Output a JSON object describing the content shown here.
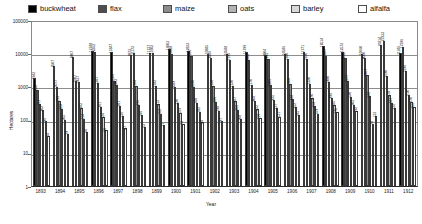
{
  "chart_data": {
    "type": "bar",
    "title": "",
    "xlabel": "Year",
    "ylabel": "Hectares",
    "yscale": "log",
    "ylim": [
      1,
      100000
    ],
    "ytick_labels": [
      "100000",
      "10000",
      "1000",
      "100",
      "10",
      "1"
    ],
    "grid": true,
    "legend_position": "top",
    "categories": [
      "1893",
      "1894",
      "1895",
      "1896",
      "1897",
      "1898",
      "1899",
      "1900",
      "1901",
      "1902",
      "1903",
      "1904",
      "1905",
      "1906",
      "1907",
      "1908",
      "1909",
      "1910",
      "1911",
      "1912"
    ],
    "series": [
      {
        "name": "buckwheat",
        "color": "#000000",
        "values": [
          1942,
          4507,
          8407,
          12748,
          11847,
          9873,
          11737,
          14603,
          12833,
          10885,
          10588,
          11799,
          9904,
          10586,
          11771,
          18514,
          12572,
          10660,
          20214,
          11186
        ]
      },
      {
        "name": "flax",
        "color": "#4d4d4d",
        "values": [
          858,
          1077,
          1607,
          12362,
          1626,
          11172,
          11602,
          10348,
          9186,
          8246,
          7196,
          6904,
          7295,
          7280,
          7240,
          9347,
          8042,
          8000,
          27233,
          17396
        ]
      },
      {
        "name": "maize",
        "color": "#8c8c8c",
        "values": [
          311,
          393,
          1437,
          1347,
          1203,
          1144,
          1142,
          1049,
          1080,
          1150,
          1120,
          1170,
          1206,
          1300,
          1320,
          1480,
          1577,
          2407,
          2190,
          3196
        ]
      },
      {
        "name": "oats",
        "color": "#b3b3b3",
        "values": [
          202,
          223,
          242,
          261,
          281,
          296,
          312,
          330,
          348,
          366,
          387,
          404,
          425,
          448,
          470,
          496,
          520,
          548,
          578,
          610
        ]
      },
      {
        "name": "barley",
        "color": "#d9d9d9",
        "values": [
          96,
          105,
          114,
          124,
          136,
          146,
          158,
          169,
          182,
          194,
          208,
          222,
          237,
          252,
          268,
          286,
          305,
          78,
          347,
          370
        ]
      },
      {
        "name": "alfalfa",
        "color": "#ffffff",
        "values": [
          34,
          39,
          44,
          50,
          57,
          63,
          71,
          79,
          88,
          97,
          108,
          119,
          131,
          145,
          159,
          175,
          192,
          133,
          232,
          255
        ]
      }
    ]
  },
  "legend": {
    "items": [
      {
        "label": "buckwheat"
      },
      {
        "label": "flax"
      },
      {
        "label": "maize"
      },
      {
        "label": "oats"
      },
      {
        "label": "barley"
      },
      {
        "label": "alfalfa"
      }
    ]
  }
}
